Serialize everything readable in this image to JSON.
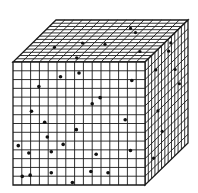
{
  "figure": {
    "colors": {
      "background": "#ffffff",
      "line": "#1a1a1a",
      "dot": "#111111",
      "face": "#ffffff"
    },
    "geometry": {
      "front": {
        "tl": [
          13,
          62
        ],
        "tr": [
          145,
          62
        ],
        "br": [
          145,
          185
        ],
        "bl": [
          13,
          185
        ]
      },
      "depth_offset": [
        43,
        -42
      ],
      "cols": 15,
      "rows": 14,
      "depth_cells": 13
    },
    "dots": {
      "front": [
        [
          0.55,
          0.2
        ],
        [
          0.84,
          0.6
        ],
        [
          0.59,
          0.09
        ],
        [
          0.62,
          0.58
        ],
        [
          0.87,
          0.12
        ],
        [
          0.13,
          0.67
        ],
        [
          0.95,
          0.25
        ],
        [
          0.3,
          0.38
        ],
        [
          0.45,
          0.7
        ],
        [
          0.12,
          0.92
        ],
        [
          0.35,
          0.49
        ],
        [
          0.88,
          0.44
        ],
        [
          0.57,
          0.66
        ],
        [
          0.73,
          0.81
        ],
        [
          0.74,
          0.89
        ],
        [
          0.35,
          0.6
        ],
        [
          0.22,
          0.9
        ],
        [
          0.79,
          0.82
        ],
        [
          0.95,
          0.89
        ],
        [
          0.16,
          0.64
        ],
        [
          0.52,
          0.91
        ],
        [
          0.28,
          0.35
        ],
        [
          0.62,
          0.43
        ],
        [
          0.54,
          1.0
        ],
        [
          0.18,
          0.18
        ],
        [
          0.35,
          0.1
        ],
        [
          0.52,
          0.28
        ],
        [
          0.3,
          0.86
        ],
        [
          0.61,
          0.1
        ]
      ],
      "front_explicit": [
        [
          0.196,
          0.2
        ],
        [
          0.36,
          0.12
        ],
        [
          0.5,
          0.09
        ],
        [
          0.9,
          0.15
        ],
        [
          0.14,
          0.4
        ],
        [
          0.24,
          0.49
        ],
        [
          0.6,
          0.34
        ],
        [
          0.66,
          0.29
        ],
        [
          0.26,
          0.61
        ],
        [
          0.85,
          0.47
        ],
        [
          0.04,
          0.68
        ],
        [
          0.12,
          0.74
        ],
        [
          0.38,
          0.67
        ],
        [
          0.48,
          0.55
        ],
        [
          0.63,
          0.75
        ],
        [
          0.29,
          0.9
        ],
        [
          0.07,
          0.93
        ],
        [
          0.59,
          0.89
        ],
        [
          0.72,
          0.9
        ],
        [
          0.45,
          0.98
        ],
        [
          0.29,
          0.73
        ],
        [
          0.13,
          0.92
        ],
        [
          0.89,
          0.72
        ]
      ],
      "top": [
        [
          0.2,
          0.65
        ],
        [
          0.38,
          0.55
        ],
        [
          0.45,
          0.9
        ],
        [
          0.56,
          0.58
        ],
        [
          0.63,
          0.2
        ],
        [
          0.7,
          0.3
        ],
        [
          0.88,
          0.75
        ]
      ],
      "side": [
        [
          0.25,
          0.15
        ],
        [
          0.55,
          0.1
        ],
        [
          0.3,
          0.5
        ],
        [
          0.7,
          0.3
        ],
        [
          0.8,
          0.45
        ],
        [
          0.4,
          0.7
        ],
        [
          0.2,
          0.85
        ],
        [
          0.6,
          0.05
        ]
      ]
    }
  }
}
